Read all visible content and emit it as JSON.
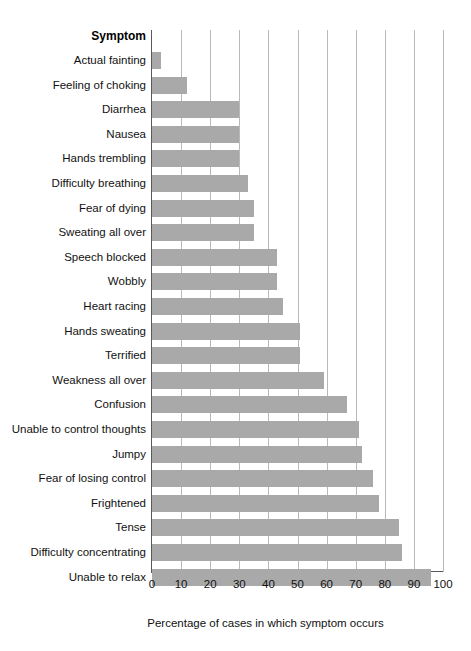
{
  "chart_data": {
    "type": "bar",
    "orientation": "horizontal",
    "title": "",
    "category_axis_title": "Symptom",
    "xlabel": "Percentage of cases in which symptom occurs",
    "ylabel": "Symptom",
    "xlim": [
      0,
      100
    ],
    "xticks": [
      "0",
      "10",
      "20",
      "30",
      "40",
      "50",
      "60",
      "70",
      "80",
      "90",
      "100"
    ],
    "grid": "vertical",
    "legend": "none",
    "bar_color": "#a9a9a9",
    "axis_color": "#5a5a5a",
    "gridline_color": "#b9b9b9",
    "categories": [
      "Actual fainting",
      "Feeling of choking",
      "Diarrhea",
      "Nausea",
      "Hands trembling",
      "Difficulty breathing",
      "Fear of dying",
      "Sweating all over",
      "Speech blocked",
      "Wobbly",
      "Heart racing",
      "Hands sweating",
      "Terrified",
      "Weakness all over",
      "Confusion",
      "Unable to control thoughts",
      "Jumpy",
      "Fear of losing control",
      "Frightened",
      "Tense",
      "Difficulty concentrating",
      "Unable to relax"
    ],
    "values": [
      3,
      12,
      30,
      30,
      30,
      33,
      35,
      35,
      43,
      43,
      45,
      51,
      51,
      59,
      67,
      71,
      72,
      76,
      78,
      85,
      86,
      96
    ]
  }
}
